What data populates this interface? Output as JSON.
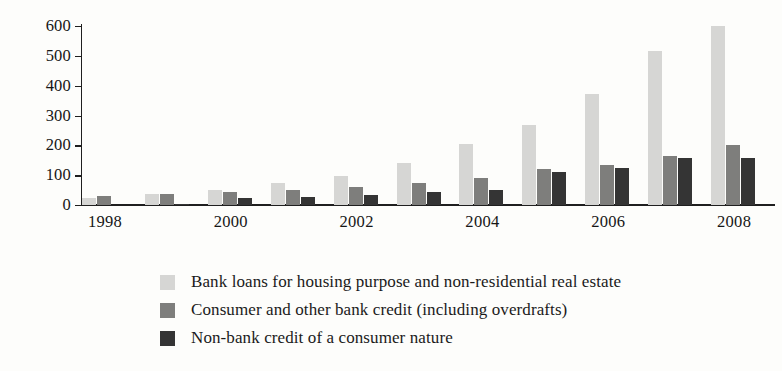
{
  "chart_data": {
    "type": "bar",
    "title": "",
    "subtitle": "",
    "xlabel": "",
    "ylabel": "",
    "ylim": [
      0,
      600
    ],
    "yticks": [
      0,
      100,
      200,
      300,
      400,
      500,
      600
    ],
    "grid": false,
    "legend_position": "bottom-left",
    "categories": [
      "1998",
      "1999",
      "2000",
      "2001",
      "2002",
      "2003",
      "2004",
      "2005",
      "2006",
      "2007",
      "2008"
    ],
    "xtick_labels": [
      "1998",
      "2000",
      "2002",
      "2004",
      "2006",
      "2008"
    ],
    "series": [
      {
        "name": "Bank loans for housing purpose and non-residential real estate",
        "color": "#d6d6d4",
        "values": [
          25,
          38,
          52,
          73,
          98,
          140,
          205,
          268,
          372,
          515,
          600
        ]
      },
      {
        "name": "Consumer and other bank credit (including overdrafts)",
        "color": "#7e7e7c",
        "values": [
          30,
          38,
          45,
          52,
          62,
          75,
          90,
          120,
          135,
          163,
          200
        ]
      },
      {
        "name": "Non-bank credit of a consumer nature",
        "color": "#343434",
        "values": [
          0,
          5,
          22,
          28,
          35,
          45,
          50,
          110,
          125,
          157,
          158
        ]
      }
    ]
  }
}
